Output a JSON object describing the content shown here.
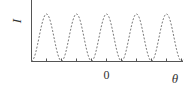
{
  "figure": {
    "y_axis_label": "I",
    "x_axis_label": "θ",
    "x_tick_label_zero": "0",
    "curve_style": "dashed",
    "colors": {
      "axis": "#555555",
      "curve": "#777777",
      "text": "#333333"
    }
  },
  "chart_data": {
    "type": "line",
    "title": "",
    "xlabel": "θ",
    "ylabel": "I",
    "series": [
      {
        "name": "I(θ)",
        "style": "dashed",
        "peaks_x_units": [
          -2,
          -1,
          0,
          1,
          2
        ],
        "minima_x_units": [
          -2.5,
          -1.5,
          -0.5,
          0.5,
          1.5,
          2.5
        ],
        "peak_value": 1,
        "min_value": 0
      }
    ],
    "x_ticks": [
      "",
      "",
      "",
      "",
      "",
      "0",
      "",
      "",
      "",
      "",
      ""
    ],
    "grid": false,
    "legend": null
  }
}
